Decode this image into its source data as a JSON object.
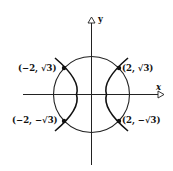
{
  "axes": {
    "x_label": "x",
    "y_label": "y"
  },
  "points": [
    {
      "label": "(−2, √3)"
    },
    {
      "label": "(2, √3)"
    },
    {
      "label": "(−2, −√3)"
    },
    {
      "label": "(2, −√3)"
    }
  ],
  "curves": [
    "circle x² + y² = 7",
    "hyperbola x² − y² = 1"
  ]
}
